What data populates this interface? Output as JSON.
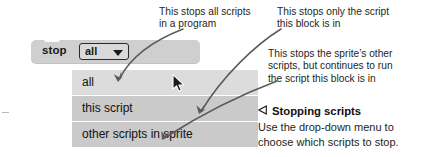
{
  "block": {
    "label": "stop",
    "field_value": "all",
    "caret_icon": "chevron-down-icon",
    "block_color": "#cfcfcf",
    "field_color": "#d9d9d9"
  },
  "dropdown": {
    "items": [
      {
        "label": "all",
        "shade": "#dcdcdc"
      },
      {
        "label": "this script",
        "shade": "#cacaca"
      },
      {
        "label": "other scripts in sprite",
        "shade": "#cacaca"
      }
    ]
  },
  "cursor": {
    "icon": "mouse-pointer-icon"
  },
  "callouts": [
    {
      "id": "all",
      "line1": "This stops all scripts",
      "line2": "in a program"
    },
    {
      "id": "this-script",
      "line1": "This stops only the script",
      "line2": "this block is in"
    },
    {
      "id": "other-scripts",
      "line1": "This stops the sprite’s other",
      "line2": "scripts, but continues to run",
      "line3": "the script this block is in"
    }
  ],
  "caption": {
    "marker_icon": "triangle-left-outline-icon",
    "title": "Stopping scripts",
    "line1": "Use the drop-down menu to",
    "line2": "choose which scripts to stop."
  },
  "colors": {
    "text": "#231f20",
    "arrow": "#555555",
    "page_background": "#ffffff"
  }
}
